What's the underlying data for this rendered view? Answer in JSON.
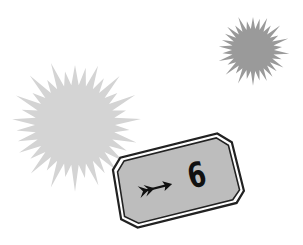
{
  "scene": {
    "background_color": "#ffffff",
    "bursts": [
      {
        "name": "large-light-burst",
        "color": "#d4d4d4",
        "cx": 75,
        "cy": 125,
        "inner_r": 40,
        "outer_r": 60,
        "spikes": 34
      },
      {
        "name": "small-dark-burst",
        "color": "#9a9a9a",
        "cx": 253,
        "cy": 50,
        "inner_r": 21,
        "outer_r": 33,
        "spikes": 30
      }
    ],
    "badge": {
      "fill_color": "#bdbdbd",
      "border_color": "#222222",
      "icon": "arrow-right-icon",
      "value": "6",
      "rotation_deg": -14
    }
  }
}
